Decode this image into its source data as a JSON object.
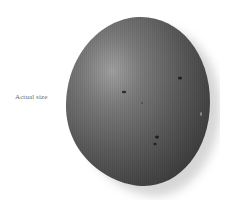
{
  "figure": {
    "caption": "Actual size",
    "colors": {
      "background": "#ffffff",
      "shell_dark": "#3e3e3e",
      "shell_mid": "#5e5e5e",
      "shell_highlight": "#9a9a9a",
      "shadow": "#d8d8d8",
      "caption_text": "#6a6a6a"
    }
  }
}
